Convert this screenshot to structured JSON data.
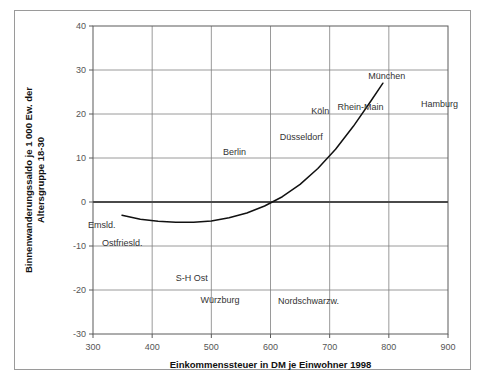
{
  "chart_data": {
    "type": "scatter",
    "title": "",
    "xlabel": "Einkommenssteuer in DM je Einwohner 1998",
    "ylabel": "Binnenwanderungssaldo je 1 000 Ew. der Altersgruppe 18-30",
    "xlim": [
      300,
      900
    ],
    "ylim": [
      -30,
      40
    ],
    "xticks": [
      300,
      400,
      500,
      600,
      700,
      800,
      900
    ],
    "yticks": [
      40,
      30,
      20,
      10,
      0,
      -10,
      -20,
      -30
    ],
    "grid": true,
    "legend": "none",
    "zero_line": 0,
    "colors": {
      "grid": "#808080",
      "axis": "#5a5a5a",
      "zero_line": "#4a4a4a",
      "point_grey": "#9a9a9a",
      "point_highlight": "#111111",
      "trend": "#111111",
      "frame": "#9a9a9a",
      "tick_text": "#555555",
      "label_text": "#333333"
    },
    "series": [
      {
        "name": "Regionen (unbeschriftet)",
        "marker": "diamond",
        "color": "#9a9a9a",
        "points": [
          [
            352,
            -4.2
          ],
          [
            372,
            -5.4
          ],
          [
            382,
            -4.8
          ],
          [
            394,
            -0.6
          ],
          [
            399,
            -6.6
          ],
          [
            404,
            7.6
          ],
          [
            408,
            -4.9
          ],
          [
            412,
            -8.1
          ],
          [
            417,
            -13.0
          ],
          [
            421,
            -5.0
          ],
          [
            432,
            -4.5
          ],
          [
            437,
            -9.2
          ],
          [
            441,
            2.1
          ],
          [
            444,
            -5.8
          ],
          [
            449,
            -7.6
          ],
          [
            452,
            4.6
          ],
          [
            456,
            -1.2
          ],
          [
            458,
            -8.6
          ],
          [
            461,
            -4.4
          ],
          [
            464,
            -10.2
          ],
          [
            468,
            -0.3
          ],
          [
            470,
            8.8
          ],
          [
            473,
            -2.2
          ],
          [
            476,
            -5.2
          ],
          [
            478,
            -7.4
          ],
          [
            481,
            -9.5
          ],
          [
            484,
            -3.1
          ],
          [
            487,
            -0.9
          ],
          [
            489,
            5.4
          ],
          [
            492,
            -6.8
          ],
          [
            495,
            -11.4
          ],
          [
            498,
            -2.6
          ],
          [
            501,
            2.4
          ],
          [
            503,
            13.0
          ],
          [
            506,
            -4.2
          ],
          [
            509,
            -7.1
          ],
          [
            512,
            -9.0
          ],
          [
            515,
            0.6
          ],
          [
            518,
            6.2
          ],
          [
            521,
            -3.4
          ],
          [
            524,
            -5.6
          ],
          [
            527,
            -12.6
          ],
          [
            530,
            -1.4
          ],
          [
            533,
            3.2
          ],
          [
            536,
            -6.2
          ],
          [
            539,
            -8.4
          ],
          [
            542,
            1.2
          ],
          [
            545,
            -2.8
          ],
          [
            548,
            -4.6
          ],
          [
            551,
            9.0
          ],
          [
            554,
            -7.8
          ],
          [
            557,
            -10.6
          ],
          [
            560,
            5.0
          ],
          [
            563,
            -1.8
          ],
          [
            566,
            -3.6
          ],
          [
            569,
            -5.0
          ],
          [
            572,
            6.8
          ],
          [
            575,
            -8.8
          ],
          [
            578,
            0.2
          ],
          [
            581,
            2.8
          ],
          [
            584,
            -4.0
          ],
          [
            587,
            -6.4
          ],
          [
            590,
            4.2
          ],
          [
            593,
            -2.0
          ],
          [
            596,
            -9.4
          ],
          [
            599,
            8.2
          ],
          [
            602,
            -5.8
          ],
          [
            605,
            1.6
          ],
          [
            608,
            -3.2
          ],
          [
            612,
            -7.2
          ],
          [
            616,
            6.0
          ],
          [
            620,
            -1.0
          ],
          [
            624,
            -19.0
          ],
          [
            628,
            3.6
          ],
          [
            632,
            -4.8
          ],
          [
            636,
            0.8
          ],
          [
            641,
            7.0
          ],
          [
            646,
            -2.4
          ],
          [
            651,
            5.2
          ],
          [
            656,
            -6.0
          ],
          [
            661,
            2.2
          ],
          [
            666,
            9.6
          ],
          [
            671,
            -3.8
          ],
          [
            678,
            14.4
          ],
          [
            686,
            4.0
          ],
          [
            694,
            8.6
          ],
          [
            702,
            1.0
          ],
          [
            712,
            11.4
          ],
          [
            724,
            6.4
          ],
          [
            742,
            3.4
          ]
        ]
      },
      {
        "name": "Hervorgehobene Regionen",
        "marker": "diamond-filled",
        "color": "#111111",
        "points": [
          {
            "x": 349,
            "y": -3.0,
            "label": "Emsld.",
            "label_dx": -34,
            "label_dy": 13
          },
          {
            "x": 393,
            "y": -7.5,
            "label": "Ostfriesld.",
            "label_dx": -46,
            "label_dy": 11
          },
          {
            "x": 503,
            "y": 11.5,
            "label": "Berlin",
            "label_dx": 10,
            "label_dy": 4
          },
          {
            "x": 511,
            "y": -17.3,
            "label": "S-H Ost",
            "label_dx": -42,
            "label_dy": 3
          },
          {
            "x": 519,
            "y": -19.3,
            "label": "Würzburg",
            "label_dx": -22,
            "label_dy": 16
          },
          {
            "x": 623,
            "y": -19.5,
            "label": "Nordschwarzw.",
            "label_dx": -6,
            "label_dy": 16
          },
          {
            "x": 679,
            "y": 18.0,
            "label": "Köln",
            "label_dx": -6,
            "label_dy": -9
          },
          {
            "x": 690,
            "y": 12.6,
            "label": "Düsseldorf",
            "label_dx": -44,
            "label_dy": -7
          },
          {
            "x": 727,
            "y": 18.8,
            "label": "Rhein-Main",
            "label_dx": -8,
            "label_dy": -9
          },
          {
            "x": 782,
            "y": 25.8,
            "label": "München",
            "label_dx": -10,
            "label_dy": -10
          },
          {
            "x": 841,
            "y": 20.6,
            "label": "Hamburg",
            "label_dx": 8,
            "label_dy": -4
          }
        ]
      }
    ],
    "trend_curve": {
      "name": "Trendkurve",
      "color": "#111111",
      "points": [
        [
          349,
          -3.0
        ],
        [
          380,
          -3.9
        ],
        [
          410,
          -4.4
        ],
        [
          440,
          -4.6
        ],
        [
          470,
          -4.6
        ],
        [
          500,
          -4.3
        ],
        [
          530,
          -3.6
        ],
        [
          560,
          -2.5
        ],
        [
          590,
          -0.9
        ],
        [
          620,
          1.2
        ],
        [
          650,
          4.0
        ],
        [
          680,
          7.6
        ],
        [
          710,
          12.0
        ],
        [
          740,
          17.2
        ],
        [
          770,
          23.0
        ],
        [
          790,
          27.0
        ]
      ]
    }
  }
}
